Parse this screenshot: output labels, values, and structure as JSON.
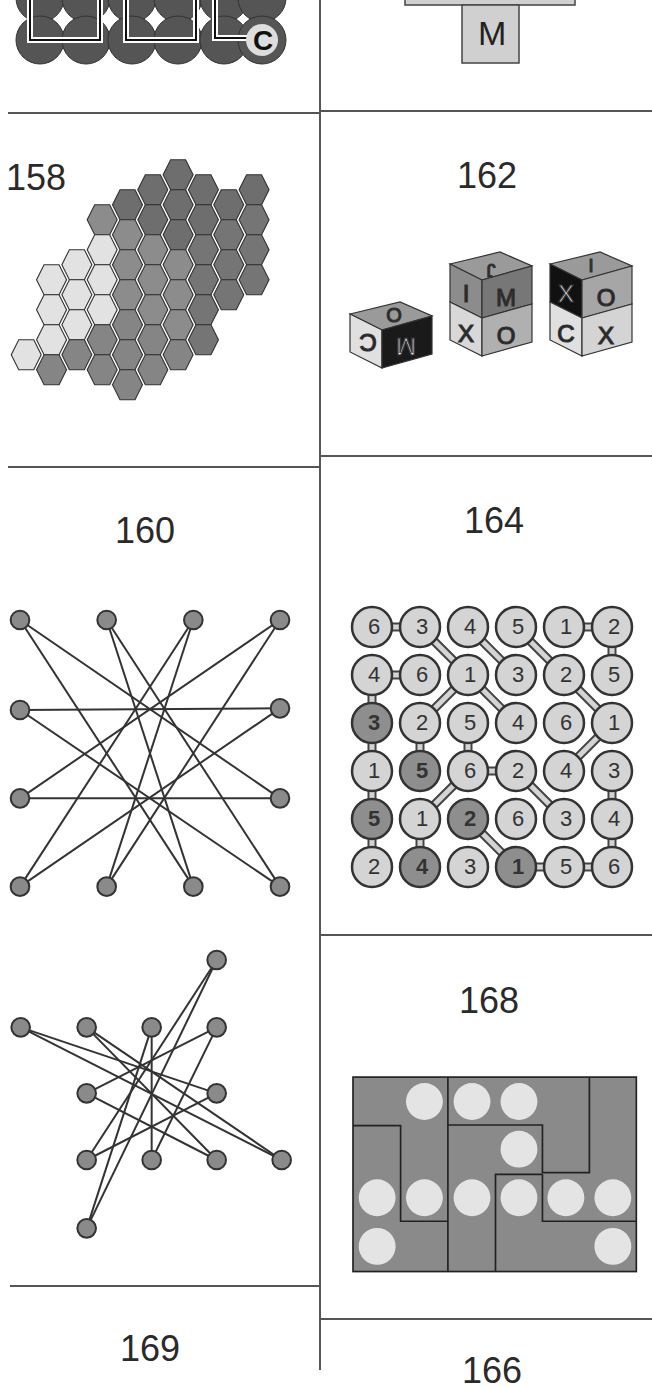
{
  "page": {
    "puzzles": [
      {
        "id": "top-left-fragment",
        "label": "",
        "letters": [
          "D",
          "G",
          "A",
          "D",
          "C"
        ]
      },
      {
        "id": "top-right-fragment",
        "label": "",
        "letters": [
          "M"
        ]
      },
      {
        "id": "p158",
        "label": "158"
      },
      {
        "id": "p162",
        "label": "162",
        "cubes": [
          {
            "top": "O",
            "left": "C",
            "right": "M"
          },
          {
            "top": "J",
            "left": "I",
            "right": "M",
            "left_lower": "X",
            "right_lower": "O"
          },
          {
            "top": "I",
            "left": "X",
            "right": "O",
            "left_lower": "C",
            "right_lower": "X"
          }
        ]
      },
      {
        "id": "p160",
        "label": "160"
      },
      {
        "id": "p164",
        "label": "164",
        "grid": [
          [
            "6",
            "3",
            "4",
            "5",
            "1",
            "2"
          ],
          [
            "4",
            "6",
            "1",
            "3",
            "2",
            "5"
          ],
          [
            "3",
            "2",
            "5",
            "4",
            "6",
            "1"
          ],
          [
            "1",
            "5",
            "6",
            "2",
            "4",
            "3"
          ],
          [
            "5",
            "1",
            "2",
            "6",
            "3",
            "4"
          ],
          [
            "2",
            "4",
            "3",
            "1",
            "5",
            "6"
          ]
        ],
        "shaded": [
          [
            2,
            0
          ],
          [
            3,
            1
          ],
          [
            4,
            0
          ],
          [
            4,
            2
          ],
          [
            5,
            1
          ],
          [
            5,
            3
          ]
        ]
      },
      {
        "id": "p-untitled-graph",
        "label": ""
      },
      {
        "id": "p168",
        "label": "168"
      },
      {
        "id": "p169",
        "label": "169"
      },
      {
        "id": "p-bottom-right",
        "label": "166"
      }
    ]
  },
  "colors": {
    "line": "#555555",
    "node_fill": "#8a8a8a",
    "hex_light": "#e2e2e2",
    "hex_mid": "#8c8c8c",
    "hex_dark": "#6e6e6e",
    "circle_fill": "#d4d4d4",
    "circle_shaded": "#8e8e8e",
    "board": "#8a8a8a",
    "hole": "#e4e4e4"
  }
}
